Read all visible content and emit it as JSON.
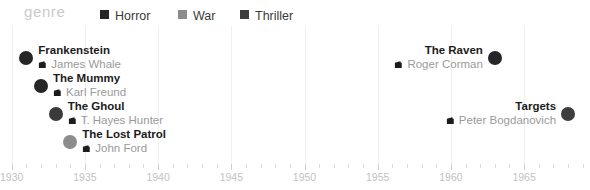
{
  "legend": {
    "title": "genre",
    "items": [
      {
        "label": "Horror",
        "color": "#262626"
      },
      {
        "label": "War",
        "color": "#8c8c8c"
      },
      {
        "label": "Thriller",
        "color": "#3d3d3d"
      }
    ]
  },
  "icons": {
    "camera": "movie-camera-icon"
  },
  "axis": {
    "min": 1929.2,
    "max": 1969.5,
    "major_ticks": [
      1930,
      1935,
      1940,
      1945,
      1950,
      1955,
      1960,
      1965
    ],
    "tick_labels": [
      "1930",
      "1935",
      "1940",
      "1945",
      "1950",
      "1955",
      "1960",
      "1965"
    ],
    "minor_step": 1
  },
  "chart_data": {
    "type": "scatter",
    "title": "genre",
    "xlabel": "",
    "ylabel": "",
    "xlim": [
      1929.2,
      1969.5
    ],
    "grid": true,
    "legend_position": "top",
    "series": [
      {
        "name": "Horror",
        "color": "#262626"
      },
      {
        "name": "War",
        "color": "#8c8c8c"
      },
      {
        "name": "Thriller",
        "color": "#3d3d3d"
      }
    ],
    "points": [
      {
        "title": "Frankenstein",
        "director": "James Whale",
        "year": 1931,
        "genre": "Horror",
        "color": "#262626",
        "side": "left",
        "row": 0
      },
      {
        "title": "The Mummy",
        "director": "Karl Freund",
        "year": 1932,
        "genre": "Horror",
        "color": "#262626",
        "side": "left",
        "row": 1
      },
      {
        "title": "The Ghoul",
        "director": "T. Hayes Hunter",
        "year": 1933,
        "genre": "Horror",
        "color": "#3a3a3a",
        "side": "left",
        "row": 2
      },
      {
        "title": "The Lost Patrol",
        "director": "John Ford",
        "year": 1934,
        "genre": "War",
        "color": "#8c8c8c",
        "side": "left",
        "row": 3
      },
      {
        "title": "The Raven",
        "director": "Roger Corman",
        "year": 1963,
        "genre": "Horror",
        "color": "#262626",
        "side": "right",
        "row": 0
      },
      {
        "title": "Targets",
        "director": "Peter Bogdanovich",
        "year": 1968,
        "genre": "Thriller",
        "color": "#3d3d3d",
        "side": "right",
        "row": 2
      }
    ]
  }
}
